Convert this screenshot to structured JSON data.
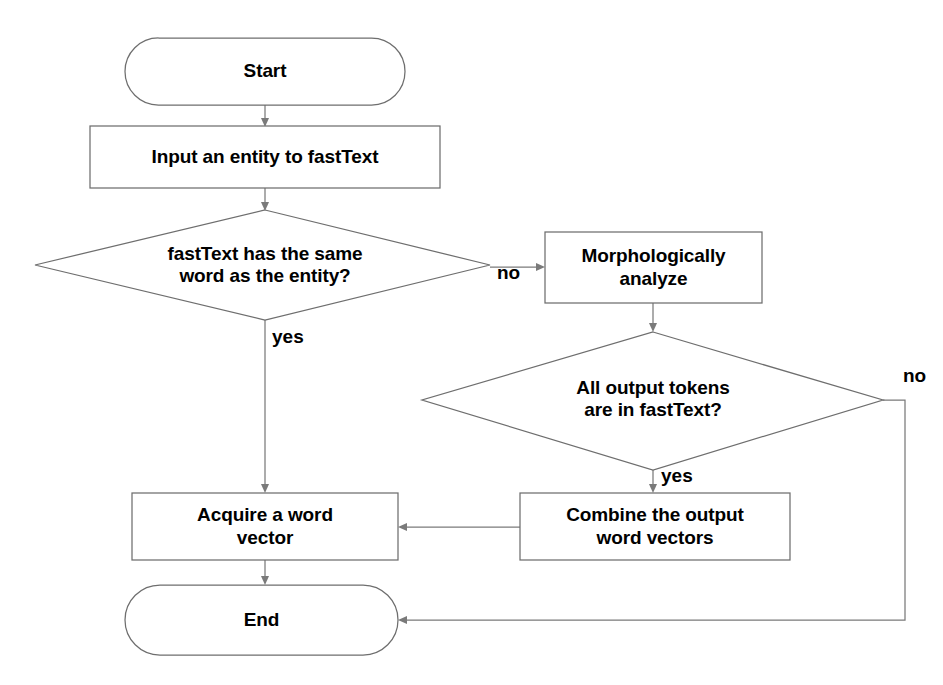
{
  "diagram": {
    "type": "flowchart",
    "colors": {
      "stroke": "#6e6e6e",
      "connector": "#7a7a7a",
      "text": "#000000",
      "background": "#ffffff"
    },
    "nodes": [
      {
        "id": "start",
        "shape": "terminator",
        "label": "Start"
      },
      {
        "id": "input-entity",
        "shape": "process",
        "label": "Input an entity to fastText"
      },
      {
        "id": "same-word-decision",
        "shape": "decision",
        "label": "fastText has the same\nword as the entity?"
      },
      {
        "id": "morphologically-analyze",
        "shape": "process",
        "label": "Morphologically\nanalyze"
      },
      {
        "id": "tokens-decision",
        "shape": "decision",
        "label": "All output tokens\nare in fastText?"
      },
      {
        "id": "combine-vectors",
        "shape": "process",
        "label": "Combine the output\nword vectors"
      },
      {
        "id": "acquire-vector",
        "shape": "process",
        "label": "Acquire a word\nvector"
      },
      {
        "id": "end",
        "shape": "terminator",
        "label": "End"
      }
    ],
    "edges": [
      {
        "id": "start-to-input",
        "from": "start",
        "to": "input-entity",
        "label": ""
      },
      {
        "id": "input-to-same-word",
        "from": "input-entity",
        "to": "same-word-decision",
        "label": ""
      },
      {
        "id": "same-word-yes",
        "from": "same-word-decision",
        "to": "acquire-vector",
        "label": "yes"
      },
      {
        "id": "same-word-no",
        "from": "same-word-decision",
        "to": "morphologically-analyze",
        "label": "no"
      },
      {
        "id": "analyze-to-tokens",
        "from": "morphologically-analyze",
        "to": "tokens-decision",
        "label": ""
      },
      {
        "id": "tokens-yes",
        "from": "tokens-decision",
        "to": "combine-vectors",
        "label": "yes"
      },
      {
        "id": "tokens-no",
        "from": "tokens-decision",
        "to": "end",
        "label": "no"
      },
      {
        "id": "combine-to-acquire",
        "from": "combine-vectors",
        "to": "acquire-vector",
        "label": ""
      },
      {
        "id": "acquire-to-end",
        "from": "acquire-vector",
        "to": "end",
        "label": ""
      }
    ]
  }
}
